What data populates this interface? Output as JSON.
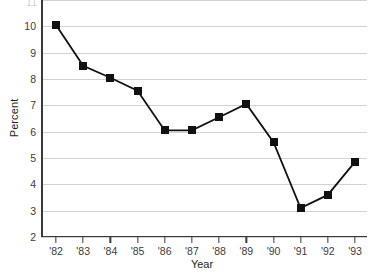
{
  "chart_data": {
    "type": "line",
    "title": "",
    "subtitle": "",
    "xlabel": "Year",
    "ylabel": "Percent",
    "categories": [
      "'82",
      "'83",
      "'84",
      "'85",
      "'86",
      "'87",
      "'88",
      "'89",
      "'90",
      "'91",
      "'92",
      "'93"
    ],
    "values": [
      10.05,
      8.5,
      8.05,
      7.55,
      6.05,
      6.05,
      6.55,
      7.05,
      5.6,
      3.1,
      3.6,
      4.85
    ],
    "series": [
      {
        "name": "Percent",
        "values": [
          10.05,
          8.5,
          8.05,
          7.55,
          6.05,
          6.05,
          6.55,
          7.05,
          5.6,
          3.1,
          3.6,
          4.85
        ]
      }
    ],
    "ylim": [
      2,
      11
    ],
    "yticks": [
      11,
      10,
      9,
      8,
      7,
      6,
      5,
      4,
      3,
      2
    ],
    "ytick_labels": [
      "11",
      "10",
      "9",
      "8",
      "7",
      "6",
      "5",
      "4",
      "3",
      "2"
    ],
    "xtick_labels": [
      "'82",
      "'83",
      "'84",
      "'85",
      "'86",
      "'87",
      "'88",
      "'89",
      "'90",
      "'91",
      "'92",
      "'93"
    ],
    "grid": "horizontal",
    "legend_position": "none",
    "marker": "filled-square",
    "line_color": "#111111",
    "marker_color": "#111111",
    "grid_color": "#d2d2d2",
    "axis_color": "#3a3a3a",
    "background_color": "#ffffff",
    "annotations": []
  },
  "axes": {
    "y_title": "Percent",
    "x_title": "Year"
  }
}
